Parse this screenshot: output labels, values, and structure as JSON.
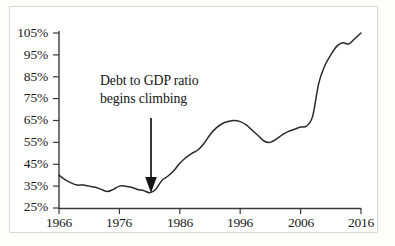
{
  "chart_data": {
    "type": "line",
    "title": "",
    "xlabel": "",
    "ylabel": "",
    "xlim": [
      1966,
      2016
    ],
    "ylim": [
      25,
      105
    ],
    "grid": false,
    "legend": null,
    "y_tick_labels": [
      "105%",
      "95%",
      "85%",
      "75%",
      "65%",
      "55%",
      "45%",
      "35%",
      "25%"
    ],
    "y_ticks": [
      105,
      95,
      85,
      75,
      65,
      55,
      45,
      35,
      25
    ],
    "x_tick_labels": [
      "1966",
      "1976",
      "1986",
      "1996",
      "2006",
      "2016"
    ],
    "x_ticks": [
      1966,
      1976,
      1986,
      1996,
      2006,
      2016
    ],
    "series": [
      {
        "name": "Debt to GDP ratio",
        "color": "#2a2a2a",
        "x": [
          1966,
          1967,
          1968,
          1969,
          1970,
          1971,
          1972,
          1973,
          1974,
          1975,
          1976,
          1977,
          1978,
          1979,
          1980,
          1981,
          1982,
          1983,
          1984,
          1985,
          1986,
          1987,
          1988,
          1989,
          1990,
          1991,
          1992,
          1993,
          1994,
          1995,
          1996,
          1997,
          1998,
          1999,
          2000,
          2001,
          2002,
          2003,
          2004,
          2005,
          2006,
          2007,
          2008,
          2009,
          2010,
          2011,
          2012,
          2013,
          2014,
          2015,
          2016
        ],
        "values": [
          40,
          38,
          36.5,
          35.5,
          35.5,
          35,
          34.5,
          33.5,
          32.5,
          33.5,
          35,
          35,
          34.5,
          33.5,
          33,
          32,
          33.5,
          37.5,
          39.5,
          42,
          45.5,
          48,
          50,
          51.5,
          54.5,
          58.5,
          61.5,
          63.5,
          64.5,
          65,
          64.5,
          63,
          60.5,
          58,
          55.5,
          55,
          56.5,
          58.5,
          60,
          61,
          62,
          62.5,
          67,
          82,
          90,
          95,
          99,
          100.5,
          100,
          102.5,
          105
        ]
      }
    ],
    "annotations": [
      {
        "name": "debt-climb-annotation",
        "line1": "Debt to GDP ratio",
        "line2": "begins climbing",
        "arrow": {
          "from_year": 1981,
          "from_value": 78,
          "to_year": 1981,
          "to_value": 33
        }
      }
    ]
  }
}
